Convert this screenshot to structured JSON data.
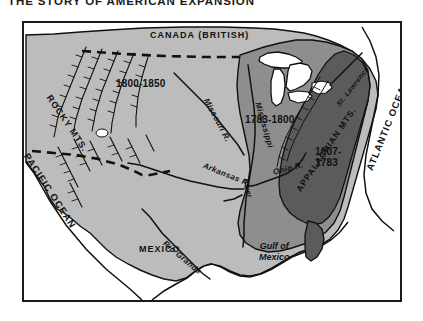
{
  "title": "THE STORY OF AMERICAN EXPANSION",
  "map": {
    "regions": {
      "canada": "CANADA (BRITISH)",
      "mexico": "MEXICO",
      "era_west": "1800-1850",
      "era_mid": "1783-1800",
      "era_east": "1607-\n1783",
      "era_east_line1": "1607-",
      "era_east_line2": "1783"
    },
    "oceans": {
      "pacific": "PACIFIC OCEAN",
      "atlantic": "ATLANTIC OCEAN",
      "gulf_line1": "Gulf of",
      "gulf_line2": "Mexico"
    },
    "mountains": {
      "rocky": "ROCKY MTS.",
      "appalachian": "APPALACHIAN MTS."
    },
    "rivers": {
      "missouri": "Missouri R.",
      "mississippi": "Mississippi",
      "mississippi_suffix": "River",
      "arkansas": "Arkansas R.",
      "ohio": "Ohio R.",
      "rio_grande": "Rio Grande",
      "st_lawrence": "St. Lawrence"
    },
    "colors": {
      "background_land": "#b9b9b9",
      "era_west_fill": "#b9b9b9",
      "era_mid_fill": "#8e8e8e",
      "era_east_fill": "#5a5a5a",
      "water": "#ffffff",
      "outline": "#111111",
      "frame": "#1a1a1a",
      "page": "#ffffff"
    }
  }
}
